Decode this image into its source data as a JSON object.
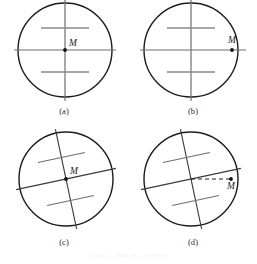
{
  "figure": {
    "caption": "Figure ... Reticle ... patterns",
    "background_color": "#ffffff",
    "stroke_color": "#1d1d1d",
    "tick_color": "#8a8a8a",
    "point_label": "M",
    "panels": [
      {
        "id": "a",
        "caption": "(a)",
        "description": "Circle with centered vertical and horizontal crosshair lines, two short gray horizontal tick marks above and below center, point M at the center.",
        "circle": {
          "cx": 65,
          "cy": 50,
          "r": 47
        },
        "rotation_deg": 0,
        "point": {
          "x": 65,
          "y": 50
        },
        "label_offset": {
          "dx": 4,
          "dy": -4
        },
        "dashed_leader": false,
        "ticks": [
          {
            "offset": -22,
            "half_width": 24
          },
          {
            "offset": 22,
            "half_width": 24
          }
        ]
      },
      {
        "id": "b",
        "caption": "(b)",
        "description": "Same crosshair reticle; point M lies on the horizontal line, displaced to the right of center near the circle edge.",
        "circle": {
          "cx": 62,
          "cy": 50,
          "r": 47
        },
        "rotation_deg": 0,
        "point": {
          "x": 103,
          "y": 50
        },
        "label_offset": {
          "dx": 2,
          "dy": -6
        },
        "dashed_leader": false,
        "ticks": [
          {
            "offset": -22,
            "half_width": 24
          },
          {
            "offset": 22,
            "half_width": 24
          }
        ]
      },
      {
        "id": "c",
        "caption": "(c)",
        "description": "Crosshair reticle rotated clockwise about 12 degrees; point M at the center of the circle.",
        "circle": {
          "cx": 66,
          "cy": 52,
          "r": 47
        },
        "rotation_deg": -12,
        "point": {
          "x": 66,
          "y": 52
        },
        "label_offset": {
          "dx": 4,
          "dy": -4
        },
        "dashed_leader": false,
        "ticks": [
          {
            "offset": -22,
            "half_width": 24
          },
          {
            "offset": 22,
            "half_width": 24
          }
        ]
      },
      {
        "id": "d",
        "caption": "(d)",
        "description": "Crosshair reticle rotated clockwise about 12 degrees; point M offset to the right near the circle edge with a dashed horizontal leader line from the reticle centre to M.",
        "circle": {
          "cx": 62,
          "cy": 52,
          "r": 47
        },
        "rotation_deg": -12,
        "point": {
          "x": 102,
          "y": 52
        },
        "label_offset": {
          "dx": 0,
          "dy": 9
        },
        "dashed_leader": true,
        "ticks": [
          {
            "offset": -22,
            "half_width": 24
          },
          {
            "offset": 22,
            "half_width": 24
          }
        ]
      }
    ]
  }
}
